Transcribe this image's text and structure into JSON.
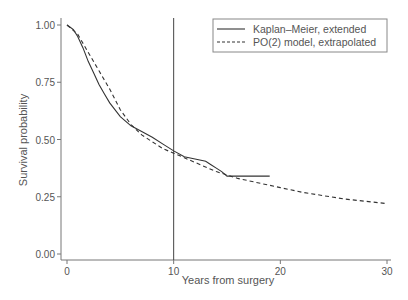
{
  "chart_data": {
    "type": "line",
    "title": "",
    "xlabel": "Years from surgery",
    "ylabel": "Survival probability",
    "xlim": [
      0,
      30
    ],
    "ylim": [
      0,
      1
    ],
    "x_ticks": [
      0,
      10,
      20,
      30
    ],
    "x_tick_labels": [
      "0",
      "10",
      "20",
      "30"
    ],
    "y_ticks": [
      0,
      0.25,
      0.5,
      0.75,
      1.0
    ],
    "y_tick_labels": [
      "0.00",
      "0.25",
      "0.50",
      "0.75",
      "1.00"
    ],
    "grid": false,
    "legend_position": "top-right",
    "reference_line": {
      "x": 10,
      "orientation": "vertical"
    },
    "series": [
      {
        "name": "Kaplan–Meier, extended",
        "style": "solid",
        "x": [
          0,
          0.3,
          0.6,
          1,
          1.5,
          2,
          2.5,
          3,
          3.5,
          4,
          5,
          6,
          7,
          8,
          9,
          10,
          11,
          12,
          13,
          13.5,
          14,
          14.5,
          15,
          16,
          17,
          18,
          19
        ],
        "y": [
          1.0,
          0.99,
          0.98,
          0.95,
          0.9,
          0.84,
          0.79,
          0.74,
          0.7,
          0.66,
          0.6,
          0.56,
          0.535,
          0.51,
          0.48,
          0.45,
          0.425,
          0.415,
          0.405,
          0.39,
          0.375,
          0.36,
          0.34,
          0.34,
          0.34,
          0.34,
          0.34
        ]
      },
      {
        "name": "PO(2) model, extrapolated",
        "style": "dashed",
        "x": [
          0,
          0.5,
          1,
          2,
          3,
          4,
          5,
          6,
          7,
          8,
          9,
          10,
          12,
          14,
          16,
          18,
          20,
          22,
          24,
          26,
          28,
          30
        ],
        "y": [
          1.0,
          0.98,
          0.96,
          0.88,
          0.8,
          0.72,
          0.63,
          0.565,
          0.52,
          0.49,
          0.46,
          0.44,
          0.4,
          0.36,
          0.33,
          0.31,
          0.29,
          0.27,
          0.255,
          0.24,
          0.23,
          0.22
        ]
      }
    ]
  },
  "legend": {
    "items": [
      {
        "label": "Kaplan–Meier, extended",
        "style": "solid"
      },
      {
        "label": "PO(2) model, extrapolated",
        "style": "dashed"
      }
    ]
  },
  "colors": {
    "line": "#333333",
    "axis": "#777777",
    "text": "#555555"
  }
}
